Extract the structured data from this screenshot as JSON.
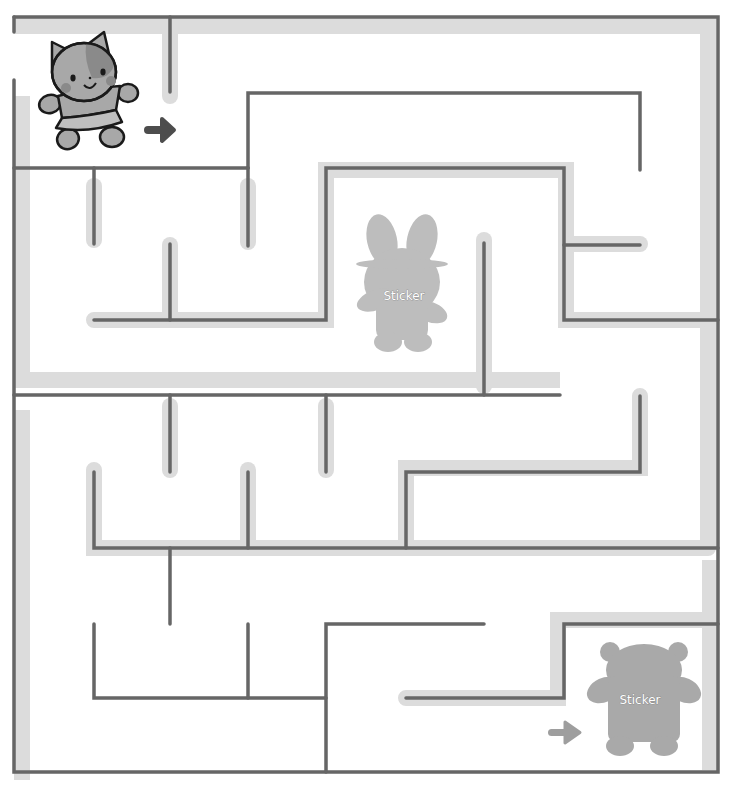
{
  "puzzle": {
    "type": "maze",
    "start_character": "cat",
    "goal_stickers": [
      {
        "character": "bunny",
        "label": "Sticker"
      },
      {
        "character": "bear",
        "label": "Sticker"
      }
    ],
    "start_arrow": "arrow-right-icon",
    "end_arrow": "arrow-right-icon"
  },
  "colors": {
    "wall": "#666666",
    "highlight": "#d9d9d9",
    "sticker": "#bdbdbd",
    "cat_body": "#a8a8a8",
    "cat_patch": "#8a8a8a",
    "cat_outline": "#1a1a1a",
    "start_arrow": "#4d4d4d",
    "end_arrow": "#9e9e9e"
  }
}
